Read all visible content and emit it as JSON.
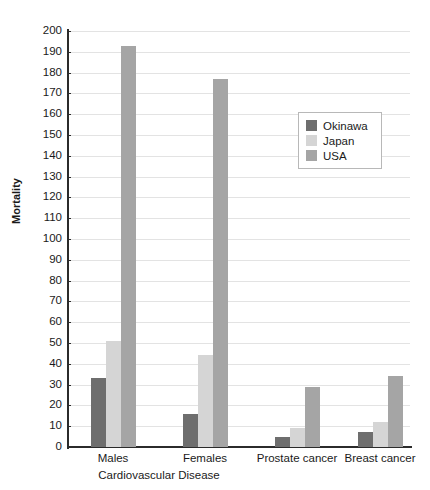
{
  "chart_data": {
    "type": "bar",
    "title": "",
    "xlabel": "",
    "ylabel": "Mortality",
    "ylim": [
      0,
      200
    ],
    "ytick_step": 10,
    "grid": true,
    "legend_position": "inside-upper-right",
    "categories": [
      "Males",
      "Females",
      "Prostate cancer",
      "Breast cancer"
    ],
    "group_bracket_label": "Cardiovascular Disease",
    "group_bracket_spans": [
      "Males",
      "Females"
    ],
    "yticks": [
      0,
      10,
      20,
      30,
      40,
      50,
      60,
      70,
      80,
      90,
      100,
      110,
      120,
      130,
      140,
      150,
      160,
      170,
      180,
      190,
      200
    ],
    "series": [
      {
        "name": "Okinawa",
        "color": "#6e6e6e",
        "values": [
          33,
          16,
          5,
          7
        ]
      },
      {
        "name": "Japan",
        "color": "#d5d5d5",
        "values": [
          51,
          44,
          9,
          12
        ]
      },
      {
        "name": "USA",
        "color": "#a5a5a5",
        "values": [
          193,
          177,
          29,
          34
        ]
      }
    ]
  },
  "axis": {
    "y_title": "Mortality"
  },
  "legend": {
    "items": [
      {
        "label": "Okinawa",
        "color": "#6e6e6e"
      },
      {
        "label": "Japan",
        "color": "#d5d5d5"
      },
      {
        "label": "USA",
        "color": "#a5a5a5"
      }
    ]
  }
}
